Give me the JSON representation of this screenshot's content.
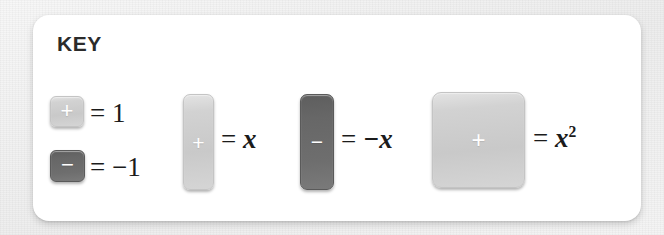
{
  "card": {
    "title": "KEY"
  },
  "legend": {
    "entries": [
      {
        "id": "unit-positive",
        "tile_sign": "+",
        "tile_shape": "small-square",
        "tile_shade": "light",
        "equals": "=",
        "value": "1",
        "value_is_italic": false,
        "full_label": "= 1"
      },
      {
        "id": "unit-negative",
        "tile_sign": "−",
        "tile_shape": "small-square",
        "tile_shade": "dark",
        "equals": "=",
        "value": "−1",
        "value_is_italic": false,
        "full_label": "= −1"
      },
      {
        "id": "x-positive",
        "tile_sign": "+",
        "tile_shape": "tall-bar",
        "tile_shade": "light",
        "equals": "=",
        "value": "x",
        "value_is_italic": true,
        "full_label": "= x"
      },
      {
        "id": "x-negative",
        "tile_sign": "−",
        "tile_shape": "tall-bar",
        "tile_shade": "dark",
        "equals": "=",
        "value": "−x",
        "value_is_italic": true,
        "full_label": "= −x"
      },
      {
        "id": "x-squared",
        "tile_sign": "+",
        "tile_shape": "large-square",
        "tile_shade": "light",
        "equals": "=",
        "value": "x",
        "exponent": "2",
        "value_is_italic": true,
        "full_label": "= x²"
      }
    ]
  },
  "colors": {
    "card_background": "#ffffff",
    "page_background": "#f3f3f3",
    "title_text": "#2b2b2b",
    "equation_text": "#1b1b1b",
    "tile_light": "#cfcfcf",
    "tile_dark": "#6a6a6a",
    "tile_sign": "#ffffff"
  }
}
